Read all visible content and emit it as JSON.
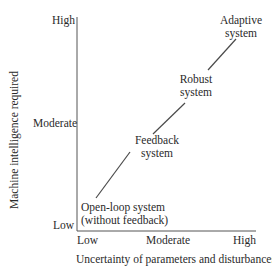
{
  "diagram": {
    "y_axis": {
      "label": "Machine intelligence required",
      "ticks": [
        "Low",
        "Moderate",
        "High"
      ]
    },
    "x_axis": {
      "label": "Uncertainty of parameters and disturbances",
      "ticks": [
        "Low",
        "Moderate",
        "High"
      ]
    },
    "nodes": [
      {
        "line1": "Open-loop system",
        "line2": "(without feedback)"
      },
      {
        "line1": "Feedback",
        "line2": "system"
      },
      {
        "line1": "Robust",
        "line2": "system"
      },
      {
        "line1": "Adaptive",
        "line2": "system"
      }
    ],
    "colors": {
      "axis": "#555555",
      "line": "#4a4a4a",
      "text": "#2a2a2a"
    }
  }
}
